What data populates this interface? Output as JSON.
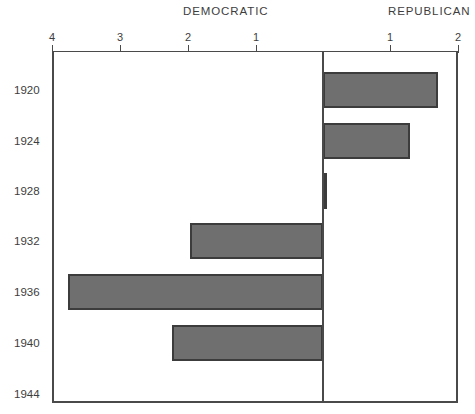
{
  "header": {
    "left_label": "DEMOCRATIC",
    "right_label": "REPUBLICAN"
  },
  "axis": {
    "ticks": [
      {
        "label": "4",
        "x": 52
      },
      {
        "label": "3",
        "x": 120
      },
      {
        "label": "2",
        "x": 188
      },
      {
        "label": "1",
        "x": 256
      },
      {
        "label": "1",
        "x": 390
      },
      {
        "label": "2",
        "x": 458
      }
    ]
  },
  "style": {
    "bar_fill": "#6f6f6f",
    "bar_border": "#3c3c3c",
    "axis_color": "#4a4a4a",
    "text_color": "#3d3d3d"
  },
  "chart_data": {
    "type": "bar",
    "orientation": "horizontal",
    "title": "",
    "subtitle": "",
    "xlabel": "",
    "ylabel": "",
    "grid": false,
    "legend_position": "top",
    "legend": [
      "DEMOCRATIC",
      "REPUBLICAN"
    ],
    "xlim": [
      -4,
      2
    ],
    "xticks": [
      -4,
      -3,
      -2,
      -1,
      0,
      1,
      2
    ],
    "xticklabels": [
      "4",
      "3",
      "2",
      "1",
      "",
      "1",
      "2"
    ],
    "axis_note": "Diverging axis: values left of zero are DEMOCRATIC, right of zero are REPUBLICAN",
    "categories": [
      "1920",
      "1924",
      "1928",
      "1932",
      "1936",
      "1940",
      "1944"
    ],
    "series": [
      {
        "name": "DEMOCRATIC",
        "values": [
          0,
          0,
          0,
          1.96,
          3.77,
          2.23,
          0
        ]
      },
      {
        "name": "REPUBLICAN",
        "values": [
          1.7,
          1.28,
          0.06,
          0,
          0,
          0,
          0
        ]
      }
    ],
    "bars": [
      {
        "year": "1920",
        "party": "REPUBLICAN",
        "value": 1.7,
        "row_center_y": 90,
        "x_start": 323,
        "x_end": 438
      },
      {
        "year": "1924",
        "party": "REPUBLICAN",
        "value": 1.28,
        "row_center_y": 141,
        "x_start": 323,
        "x_end": 410
      },
      {
        "year": "1928",
        "party": "REPUBLICAN",
        "value": 0.06,
        "row_center_y": 191,
        "x_start": 323,
        "x_end": 327
      },
      {
        "year": "1932",
        "party": "DEMOCRATIC",
        "value": 1.96,
        "row_center_y": 241,
        "x_start": 190,
        "x_end": 323
      },
      {
        "year": "1936",
        "party": "DEMOCRATIC",
        "value": 3.77,
        "row_center_y": 292,
        "x_start": 68,
        "x_end": 323
      },
      {
        "year": "1940",
        "party": "DEMOCRATIC",
        "value": 2.23,
        "row_center_y": 343,
        "x_start": 172,
        "x_end": 323
      },
      {
        "year": "1944",
        "party": "NONE",
        "value": 0,
        "row_center_y": 394,
        "x_start": 323,
        "x_end": 323
      }
    ]
  }
}
